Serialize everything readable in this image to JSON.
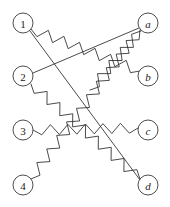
{
  "diagram": {
    "type": "bipartite-matching",
    "width": 170,
    "height": 207,
    "background_color": "#ffffff",
    "stroke_color": "#2b2b2b",
    "node_fill_color": "#ffffff",
    "node_stroke_color": "#3a3a3a",
    "node_radius": 10,
    "left_nodes": [
      {
        "id": "1",
        "label": "1",
        "cx": 23,
        "cy": 23,
        "italic": false
      },
      {
        "id": "2",
        "label": "2",
        "cx": 23,
        "cy": 76,
        "italic": false
      },
      {
        "id": "3",
        "label": "3",
        "cx": 23,
        "cy": 130,
        "italic": false
      },
      {
        "id": "4",
        "label": "4",
        "cx": 23,
        "cy": 185,
        "italic": false
      }
    ],
    "right_nodes": [
      {
        "id": "a",
        "label": "a",
        "cx": 148,
        "cy": 23,
        "italic": true
      },
      {
        "id": "b",
        "label": "b",
        "cx": 148,
        "cy": 76,
        "italic": true
      },
      {
        "id": "c",
        "label": "c",
        "cx": 148,
        "cy": 130,
        "italic": true
      },
      {
        "id": "d",
        "label": "d",
        "cx": 148,
        "cy": 185,
        "italic": true
      }
    ],
    "edges": [
      {
        "id": "edge-1-b",
        "from": "1",
        "to": "b",
        "style": "squiggle",
        "x1": 31,
        "y1": 29,
        "x2": 140,
        "y2": 71,
        "amplitude": 5.0,
        "wavelength": 8.5
      },
      {
        "id": "edge-1-d",
        "from": "1",
        "to": "d",
        "style": "straight",
        "x1": 30,
        "y1": 31,
        "x2": 140,
        "y2": 180
      },
      {
        "id": "edge-2-a",
        "from": "2",
        "to": "a",
        "style": "straight",
        "x1": 33,
        "y1": 73,
        "x2": 139,
        "y2": 28
      },
      {
        "id": "edge-2-d",
        "from": "2",
        "to": "d",
        "style": "squiggle",
        "x1": 31,
        "y1": 84,
        "x2": 140,
        "y2": 179,
        "amplitude": 5.0,
        "wavelength": 8.5
      },
      {
        "id": "edge-3-c",
        "from": "3",
        "to": "c",
        "style": "squiggle",
        "x1": 33,
        "y1": 130,
        "x2": 138,
        "y2": 128,
        "amplitude": 5.0,
        "wavelength": 8.5
      },
      {
        "id": "edge-4-a",
        "from": "4",
        "to": "a",
        "style": "squiggle",
        "x1": 31,
        "y1": 179,
        "x2": 140,
        "y2": 30,
        "amplitude": 5.0,
        "wavelength": 8.5
      },
      {
        "id": "edge-a-b",
        "from": "a",
        "to": "b",
        "style": "squiggle",
        "x1": 141,
        "y1": 31,
        "x2": 90,
        "y2": 90,
        "amplitude": 5.0,
        "wavelength": 8.5
      }
    ]
  }
}
